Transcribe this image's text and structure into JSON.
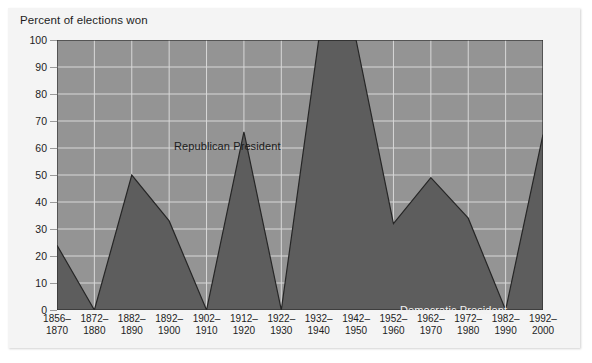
{
  "figure": {
    "axis_title": "Percent of elections won",
    "colors": {
      "upper_area": "#949494",
      "lower_area": "#5d5d5d",
      "gridline": "#d8d8d8",
      "outline": "#2a2a2a",
      "figure_background": "#f4f4f4",
      "page_background": "#ffffff"
    }
  },
  "chart_data": {
    "type": "area",
    "title": "",
    "subtitle": "",
    "xlabel": "",
    "ylabel": "Percent of elections won",
    "ylim": [
      0,
      100
    ],
    "ytick_step": 10,
    "grid": true,
    "legend_position": "inline-annotations",
    "categories": [
      "1856–\n1870",
      "1872–\n1880",
      "1882–\n1890",
      "1892–\n1900",
      "1902–\n1910",
      "1912–\n1920",
      "1922–\n1930",
      "1932–\n1940",
      "1942–\n1950",
      "1952–\n1960",
      "1962–\n1970",
      "1972–\n1980",
      "1982–\n1990",
      "1992–\n2000"
    ],
    "xtick_labels": [
      {
        "line1": "1856–",
        "line2": "1870"
      },
      {
        "line1": "1872–",
        "line2": "1880"
      },
      {
        "line1": "1882–",
        "line2": "1890"
      },
      {
        "line1": "1892–",
        "line2": "1900"
      },
      {
        "line1": "1902–",
        "line2": "1910"
      },
      {
        "line1": "1912–",
        "line2": "1920"
      },
      {
        "line1": "1922–",
        "line2": "1930"
      },
      {
        "line1": "1932–",
        "line2": "1940"
      },
      {
        "line1": "1942–",
        "line2": "1950"
      },
      {
        "line1": "1952–",
        "line2": "1960"
      },
      {
        "line1": "1962–",
        "line2": "1970"
      },
      {
        "line1": "1972–",
        "line2": "1980"
      },
      {
        "line1": "1982–",
        "line2": "1990"
      },
      {
        "line1": "1992–",
        "line2": "2000"
      }
    ],
    "ytick_labels": [
      "0",
      "10",
      "20",
      "30",
      "40",
      "50",
      "60",
      "70",
      "80",
      "90",
      "100"
    ],
    "series": [
      {
        "name": "Democratic President",
        "color": "#5d5d5d",
        "values": [
          24,
          0,
          50,
          33,
          0,
          66,
          0,
          100,
          100,
          32,
          49,
          34,
          0,
          65
        ]
      },
      {
        "name": "Republican President",
        "color": "#949494",
        "values": [
          76,
          100,
          50,
          67,
          100,
          34,
          100,
          0,
          0,
          68,
          51,
          66,
          100,
          35
        ]
      }
    ],
    "annotations": [
      {
        "text": "Republican President",
        "area": "upper"
      },
      {
        "text": "Democratic President",
        "area": "lower"
      }
    ]
  }
}
